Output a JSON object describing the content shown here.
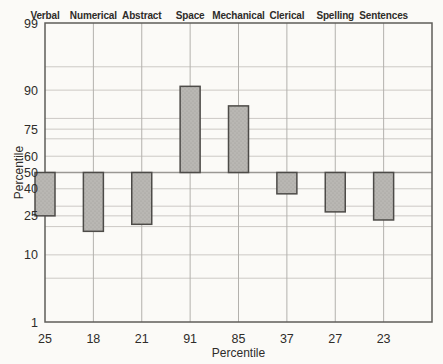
{
  "chart_data": {
    "type": "bar",
    "title": "",
    "categories": [
      "Verbal",
      "Numerical",
      "Abstract",
      "Space",
      "Mechanical",
      "Clerical",
      "Spelling",
      "Sentences"
    ],
    "values": [
      25,
      18,
      21,
      91,
      85,
      37,
      27,
      23
    ],
    "value_labels": [
      "25",
      "18",
      "21",
      "91",
      "85",
      "37",
      "27",
      "23"
    ],
    "baseline": 50,
    "bars_extend_from_baseline": true,
    "xlabel": "Percentile",
    "ylabel": "Percentile",
    "y_scale": "normal-probability",
    "ylim": [
      1,
      99
    ],
    "y_tick_labels": [
      99,
      90,
      75,
      60,
      50,
      40,
      25,
      10,
      1
    ],
    "y_gridlines": [
      99,
      95,
      90,
      80,
      75,
      70,
      60,
      50,
      40,
      30,
      25,
      20,
      10,
      5,
      1
    ],
    "grid": true,
    "legend": "none",
    "colors": {
      "background": "#fbfaf7",
      "bar_fill": "#b9b7b3",
      "bar_stipple": "#a09e9a",
      "bar_stroke": "#4d4b48",
      "grid_h": "#ccc9c5",
      "grid_v": "#b3b1ad",
      "baseline_line": "#9a9894",
      "border": "#5f5d5a",
      "text": "#2e2c29"
    }
  }
}
